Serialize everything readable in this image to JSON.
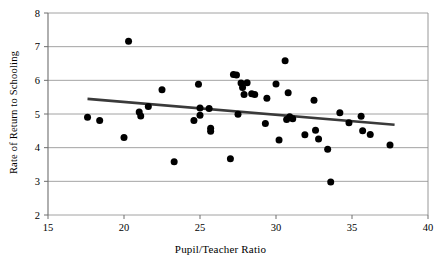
{
  "chart_data": {
    "type": "scatter",
    "title": "",
    "xlabel": "Pupil/Teacher Ratio",
    "ylabel": "Rate of Return to Schooling",
    "xlim": [
      15,
      40
    ],
    "ylim": [
      2,
      8
    ],
    "xticks": [
      15,
      20,
      25,
      30,
      35,
      40
    ],
    "yticks": [
      2,
      3,
      4,
      5,
      6,
      7,
      8
    ],
    "grid": "horizontal",
    "legend": "none",
    "marker_color": "#000000",
    "marker_shape": "circle",
    "trendline": {
      "visible": true,
      "color": "#3a3a3a",
      "x_start": 17.6,
      "y_start": 5.45,
      "x_end": 37.8,
      "y_end": 4.68,
      "slope": -0.0381,
      "intercept": 6.12
    },
    "points": [
      {
        "x": 17.6,
        "y": 4.9
      },
      {
        "x": 18.4,
        "y": 4.81
      },
      {
        "x": 20.0,
        "y": 4.3
      },
      {
        "x": 20.3,
        "y": 7.16
      },
      {
        "x": 21.0,
        "y": 5.06
      },
      {
        "x": 21.1,
        "y": 4.94
      },
      {
        "x": 21.6,
        "y": 5.22
      },
      {
        "x": 22.5,
        "y": 5.72
      },
      {
        "x": 23.3,
        "y": 3.58
      },
      {
        "x": 24.6,
        "y": 4.81
      },
      {
        "x": 24.9,
        "y": 5.88
      },
      {
        "x": 25.0,
        "y": 5.18
      },
      {
        "x": 25.0,
        "y": 4.96
      },
      {
        "x": 25.6,
        "y": 5.16
      },
      {
        "x": 25.7,
        "y": 4.58
      },
      {
        "x": 25.7,
        "y": 4.49
      },
      {
        "x": 27.0,
        "y": 3.67
      },
      {
        "x": 27.2,
        "y": 6.17
      },
      {
        "x": 27.4,
        "y": 6.16
      },
      {
        "x": 27.5,
        "y": 4.99
      },
      {
        "x": 27.7,
        "y": 5.92
      },
      {
        "x": 27.8,
        "y": 5.79
      },
      {
        "x": 27.9,
        "y": 5.58
      },
      {
        "x": 28.1,
        "y": 5.93
      },
      {
        "x": 28.4,
        "y": 5.6
      },
      {
        "x": 28.6,
        "y": 5.58
      },
      {
        "x": 29.3,
        "y": 4.72
      },
      {
        "x": 29.4,
        "y": 5.47
      },
      {
        "x": 30.0,
        "y": 5.89
      },
      {
        "x": 30.2,
        "y": 4.23
      },
      {
        "x": 30.6,
        "y": 6.58
      },
      {
        "x": 30.7,
        "y": 4.84
      },
      {
        "x": 30.8,
        "y": 5.63
      },
      {
        "x": 30.9,
        "y": 4.92
      },
      {
        "x": 31.1,
        "y": 4.86
      },
      {
        "x": 31.9,
        "y": 4.38
      },
      {
        "x": 32.5,
        "y": 5.41
      },
      {
        "x": 32.6,
        "y": 4.52
      },
      {
        "x": 32.8,
        "y": 4.26
      },
      {
        "x": 33.4,
        "y": 3.95
      },
      {
        "x": 33.6,
        "y": 2.98
      },
      {
        "x": 34.2,
        "y": 5.04
      },
      {
        "x": 34.8,
        "y": 4.74
      },
      {
        "x": 35.6,
        "y": 4.93
      },
      {
        "x": 35.7,
        "y": 4.5
      },
      {
        "x": 36.2,
        "y": 4.39
      },
      {
        "x": 37.5,
        "y": 4.08
      }
    ]
  },
  "axes": {
    "x_tick_labels": [
      "15",
      "20",
      "25",
      "30",
      "35",
      "40"
    ],
    "y_tick_labels": [
      "2",
      "3",
      "4",
      "5",
      "6",
      "7",
      "8"
    ]
  }
}
